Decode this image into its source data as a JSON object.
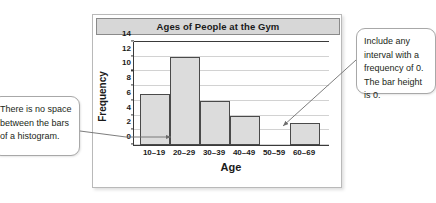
{
  "chart_data": {
    "type": "bar",
    "title": "Ages of People at the Gym",
    "xlabel": "Age",
    "ylabel": "Frequency",
    "categories": [
      "10–19",
      "20–29",
      "30–39",
      "40–49",
      "50–59",
      "60–69"
    ],
    "values": [
      7,
      12,
      6,
      4,
      0,
      3
    ],
    "yticks": [
      0,
      2,
      4,
      6,
      8,
      10,
      12,
      14
    ],
    "ylim": [
      0,
      14
    ],
    "grid": true,
    "legend": "none",
    "bar_fill": "#dcdcdc",
    "bar_stroke": "#4a4a4a"
  },
  "annotations": {
    "left": {
      "text": "There is no space between the bars of a histogram."
    },
    "right": {
      "text": "Include any interval with a frequency of 0. The bar height is 0."
    }
  }
}
